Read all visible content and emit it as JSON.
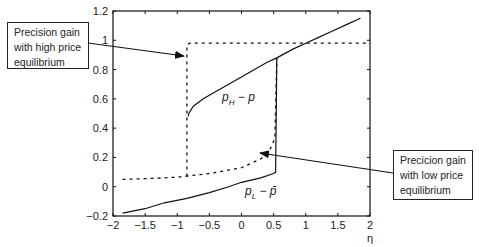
{
  "chart_data": {
    "type": "line",
    "title": "",
    "xlabel": "η",
    "ylabel": "",
    "xlim": [
      -2,
      2
    ],
    "ylim": [
      -0.2,
      1.2
    ],
    "xticks": [
      "-2",
      "-1.5",
      "-1",
      "-0.5",
      "0",
      "0.5",
      "1",
      "1.5",
      "2"
    ],
    "yticks": [
      "-0.2",
      "0",
      "0.2",
      "0.4",
      "0.6",
      "0.8",
      "1",
      "1.2"
    ],
    "grid": false,
    "series": [
      {
        "name": "p_H - p (solid, upper branch)",
        "style": "solid",
        "x": [
          -0.83,
          -0.82,
          -0.75,
          -0.6,
          -0.4,
          -0.2,
          0,
          0.2,
          0.4,
          0.55,
          0.8,
          1.0,
          1.2,
          1.4,
          1.6,
          1.85
        ],
        "y": [
          0.48,
          0.5,
          0.55,
          0.6,
          0.65,
          0.7,
          0.75,
          0.8,
          0.85,
          0.88,
          0.94,
          0.98,
          1.02,
          1.06,
          1.1,
          1.15
        ]
      },
      {
        "name": "p_L - p̄ (solid, lower branch)",
        "style": "solid",
        "x": [
          -1.85,
          -1.5,
          -1.2,
          -0.85,
          -0.5,
          -0.2,
          0,
          0.3,
          0.5,
          0.53,
          0.55
        ],
        "y": [
          -0.18,
          -0.15,
          -0.11,
          -0.08,
          -0.04,
          0.0,
          0.03,
          0.06,
          0.09,
          0.1,
          0.88
        ]
      },
      {
        "name": "Precision gain with high price equilibrium (dashed)",
        "style": "dashed",
        "x": [
          -0.85,
          -0.85,
          -0.8,
          0,
          1,
          2
        ],
        "y": [
          0.07,
          0.97,
          0.98,
          0.98,
          0.98,
          0.98
        ]
      },
      {
        "name": "Precision gain with low price equilibrium (dashed)",
        "style": "dashed",
        "x": [
          -1.85,
          -1.5,
          -1.0,
          -0.5,
          0,
          0.3,
          0.45,
          0.52,
          0.55
        ],
        "y": [
          0.05,
          0.055,
          0.065,
          0.09,
          0.13,
          0.19,
          0.26,
          0.33,
          0.88
        ]
      }
    ],
    "annotations": [
      {
        "text": "p_H − p",
        "x": -0.35,
        "y": 0.55
      },
      {
        "text": "p_L − p̄",
        "x": 0.25,
        "y": -0.07
      },
      {
        "text": "Precision gain with high price equilibrium",
        "arrow_to": [
          -0.85,
          0.9
        ]
      },
      {
        "text": "Precicion gain with low price equilibrium",
        "arrow_to": [
          0.27,
          0.32
        ]
      }
    ],
    "legend": "none"
  },
  "callouts": {
    "high": [
      "Precision gain",
      "with high price",
      "equilibrium"
    ],
    "low": [
      "Precicion gain",
      "with low price",
      "equilibrium"
    ]
  },
  "labels": {
    "ph_main": "p",
    "ph_sub": "H",
    "ph_rest": " − p",
    "pl_main": "p",
    "pl_sub": "L",
    "pl_rest": " − p̄",
    "xaxis": "η"
  }
}
